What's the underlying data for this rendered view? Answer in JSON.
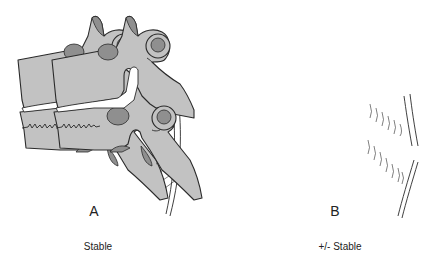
{
  "figure": {
    "panels": [
      {
        "letter": "A",
        "caption": "Stable",
        "ligament": "intact"
      },
      {
        "letter": "B",
        "caption": "+/- Stable",
        "ligament": "torn"
      }
    ],
    "colors": {
      "bone": "#c2c2c2",
      "cartilage": "#8f8f8f",
      "outline": "#2a2a2a",
      "background": "#ffffff"
    }
  }
}
